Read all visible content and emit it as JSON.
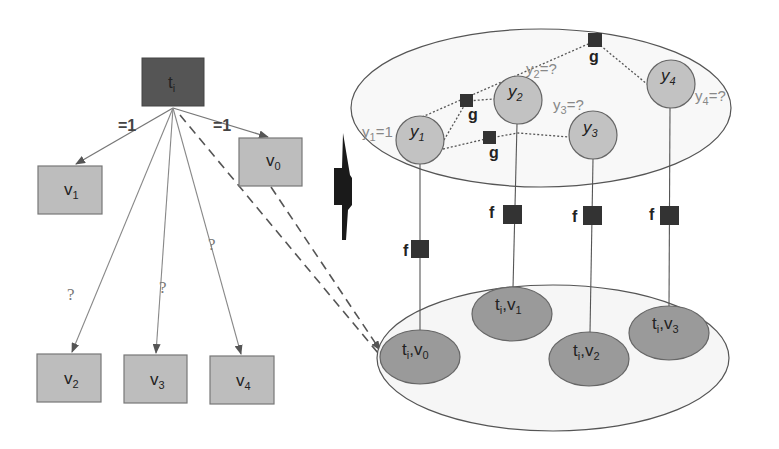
{
  "colors": {
    "dark_box": "#555555",
    "light_box": "#bdbdbd",
    "node_fill": "#c2c2c2",
    "pair_fill": "#9a9a9a",
    "factor_fill": "#333333",
    "line": "#666666",
    "ellipse_fill": "#f7f7f7"
  },
  "tree": {
    "root": {
      "label": "t",
      "sub": "i"
    },
    "children": [
      {
        "id": "v1",
        "label": "v",
        "sub": "1",
        "edge_label": "=1"
      },
      {
        "id": "v0",
        "label": "v",
        "sub": "0",
        "edge_label": "=1"
      },
      {
        "id": "v2",
        "label": "v",
        "sub": "2",
        "edge_label": "?"
      },
      {
        "id": "v3",
        "label": "v",
        "sub": "3",
        "edge_label": "?"
      },
      {
        "id": "v4",
        "label": "v",
        "sub": "4",
        "edge_label": "?"
      }
    ]
  },
  "graph": {
    "label_nodes": [
      {
        "id": "y1",
        "label": "y",
        "sub": "1",
        "value_label": "y",
        "value_sub": "1",
        "value_eq": "=1"
      },
      {
        "id": "y2",
        "label": "y",
        "sub": "2",
        "value_label": "y",
        "value_sub": "2",
        "value_eq": "=?"
      },
      {
        "id": "y3",
        "label": "y",
        "sub": "3",
        "value_label": "y",
        "value_sub": "3",
        "value_eq": "=?"
      },
      {
        "id": "y4",
        "label": "y",
        "sub": "4",
        "value_label": "y",
        "value_sub": "4",
        "value_eq": "=?"
      }
    ],
    "g_factors": [
      {
        "label": "g"
      },
      {
        "label": "g"
      },
      {
        "label": "g"
      }
    ],
    "f_factors": [
      {
        "label": "f"
      },
      {
        "label": "f"
      },
      {
        "label": "f"
      },
      {
        "label": "f"
      }
    ],
    "pair_nodes": [
      {
        "id": "tv0",
        "t": "t",
        "t_sub": "i",
        "v": ",v",
        "v_sub": "0"
      },
      {
        "id": "tv1",
        "t": "t",
        "t_sub": "i",
        "v": ",v",
        "v_sub": "1"
      },
      {
        "id": "tv2",
        "t": "t",
        "t_sub": "i",
        "v": ",v",
        "v_sub": "2"
      },
      {
        "id": "tv3",
        "t": "t",
        "t_sub": "i",
        "v": ",v",
        "v_sub": "3"
      }
    ]
  }
}
